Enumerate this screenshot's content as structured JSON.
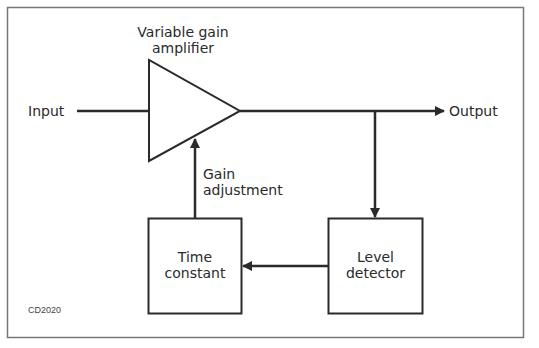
{
  "diagram": {
    "type": "block-diagram",
    "figure_code": "CD2020",
    "labels": {
      "input": "Input",
      "output": "Output",
      "amplifier_line1": "Variable gain",
      "amplifier_line2": "amplifier",
      "gain_line1": "Gain",
      "gain_line2": "adjustment",
      "time_line1": "Time",
      "time_line2": "constant",
      "level_line1": "Level",
      "level_line2": "detector"
    },
    "nodes": [
      {
        "id": "amplifier",
        "shape": "triangle",
        "label": "Variable gain amplifier"
      },
      {
        "id": "time_constant",
        "shape": "box",
        "label": "Time constant"
      },
      {
        "id": "level_detector",
        "shape": "box",
        "label": "Level detector"
      }
    ],
    "edges": [
      {
        "from": "Input",
        "to": "amplifier"
      },
      {
        "from": "amplifier",
        "to": "Output",
        "arrow": true
      },
      {
        "from": "amplifier-output-branch",
        "to": "level_detector",
        "arrow": true
      },
      {
        "from": "level_detector",
        "to": "time_constant",
        "arrow": true
      },
      {
        "from": "time_constant",
        "to": "amplifier",
        "arrow": true,
        "label": "Gain adjustment"
      }
    ],
    "colors": {
      "line": "#2a2a2a",
      "frame": "#777777",
      "background": "#ffffff"
    }
  }
}
